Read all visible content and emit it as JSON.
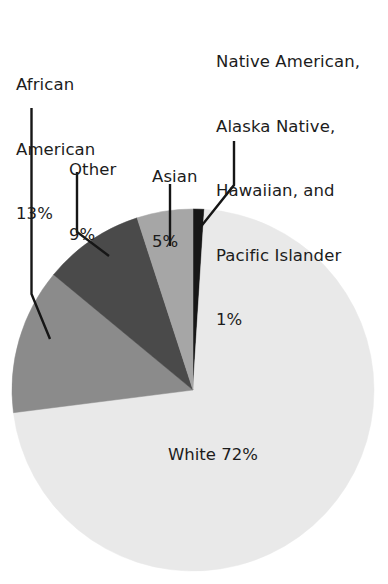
{
  "chart_data": {
    "type": "pie",
    "title": "",
    "subtitle": "",
    "xlabel": "",
    "ylabel": "",
    "legend_position": "callout-labels",
    "grid": false,
    "units": "percent",
    "start_angle_deg": 0,
    "direction": "clockwise",
    "categories": [
      "Native American, Alaska Native, Hawaiian, and Pacific Islander",
      "White",
      "African American",
      "Other",
      "Asian"
    ],
    "values": [
      1,
      72,
      13,
      9,
      5
    ],
    "slices": [
      {
        "name": "Native American, Alaska Native, Hawaiian, and Pacific Islander",
        "value": 1,
        "value_label": "1%",
        "color": "#171717",
        "label_placement": "callout",
        "label_lines": [
          "Native American,",
          "Alaska Native,",
          "Hawaiian, and",
          "Pacific Islander",
          "1%"
        ]
      },
      {
        "name": "White",
        "value": 72,
        "value_label": "72%",
        "color": "#e9e9e9",
        "label_placement": "inside",
        "label_lines": [
          "White 72%"
        ]
      },
      {
        "name": "African American",
        "value": 13,
        "value_label": "13%",
        "color": "#8b8b8b",
        "label_placement": "callout",
        "label_lines": [
          "African",
          "American",
          "13%"
        ]
      },
      {
        "name": "Other",
        "value": 9,
        "value_label": "9%",
        "color": "#4a4a4a",
        "label_placement": "callout",
        "label_lines": [
          "Other",
          "9%"
        ]
      },
      {
        "name": "Asian",
        "value": 5,
        "value_label": "5%",
        "color": "#a6a6a6",
        "label_placement": "callout",
        "label_lines": [
          "Asian",
          "5%"
        ]
      }
    ]
  },
  "labels": {
    "african_american": {
      "line1": "African",
      "line2": "American",
      "line3": "13%"
    },
    "other": {
      "line1": "Other",
      "line2": "9%"
    },
    "asian": {
      "line1": "Asian",
      "line2": "5%"
    },
    "native": {
      "line1": "Native American,",
      "line2": "Alaska Native,",
      "line3": "Hawaiian, and",
      "line4": "Pacific Islander",
      "line5": "1%"
    },
    "white": {
      "line1": "White 72%"
    }
  },
  "colors": {
    "background": "#ffffff",
    "text": "#1c1c1c",
    "leader_line": "#161616",
    "slice_white": "#e9e9e9",
    "slice_african_american": "#8b8b8b",
    "slice_other": "#4a4a4a",
    "slice_asian": "#a6a6a6",
    "slice_native": "#171717"
  }
}
